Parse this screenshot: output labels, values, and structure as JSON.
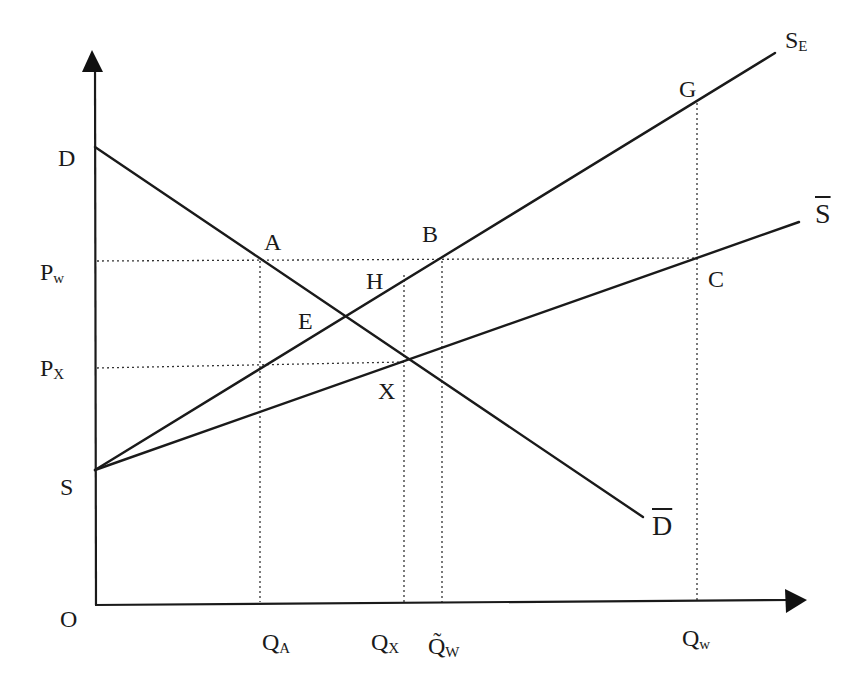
{
  "diagram": {
    "type": "supply-demand",
    "axes": {
      "origin": "O",
      "x_axis": "quantity",
      "y_axis": "price"
    },
    "price_labels": [
      {
        "id": "D",
        "text": "D"
      },
      {
        "id": "Pw",
        "main": "P",
        "sub": "w"
      },
      {
        "id": "Px",
        "main": "P",
        "sub": "X"
      },
      {
        "id": "S",
        "text": "S"
      },
      {
        "id": "O",
        "text": "O"
      }
    ],
    "quantity_labels": [
      {
        "id": "QA",
        "main": "Q",
        "sub": "A"
      },
      {
        "id": "QX",
        "main": "Q",
        "sub": "X"
      },
      {
        "id": "QWtilde",
        "main": "Q̃",
        "sub": "W"
      },
      {
        "id": "Qw",
        "main": "Q",
        "sub": "w"
      }
    ],
    "curves": [
      {
        "id": "demand",
        "label": "D",
        "overbar": true
      },
      {
        "id": "supply_bar",
        "label": "S",
        "overbar": true
      },
      {
        "id": "supply_E",
        "main": "S",
        "sub": "E"
      }
    ],
    "points": [
      "A",
      "B",
      "C",
      "E",
      "G",
      "H",
      "X"
    ],
    "colors": {
      "line": "#1a1a1a",
      "background": "#ffffff"
    }
  }
}
